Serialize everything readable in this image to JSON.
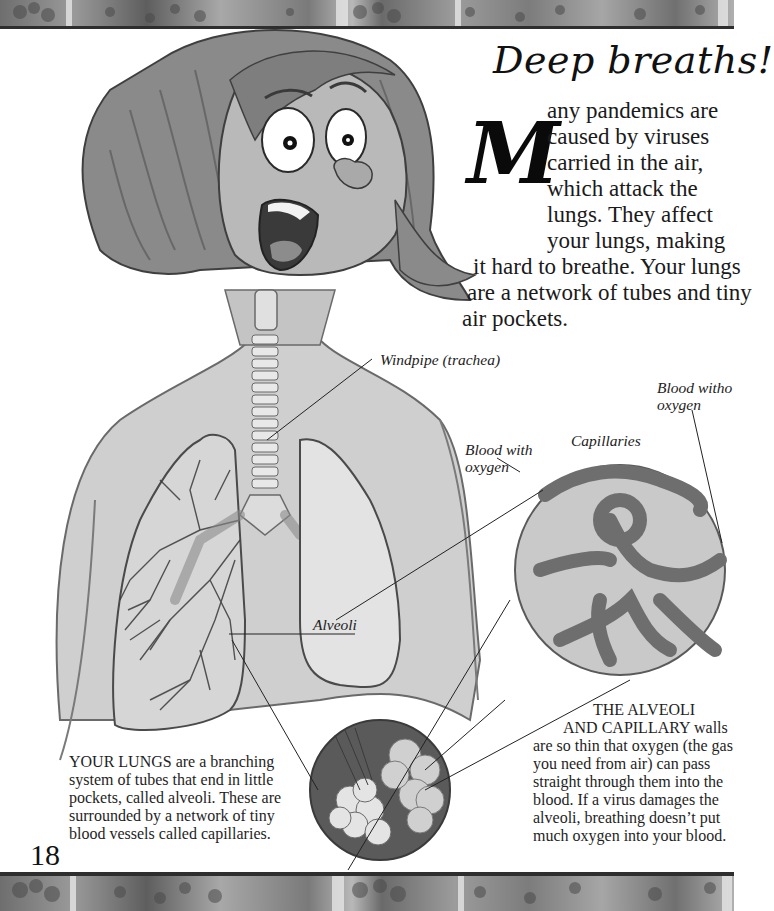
{
  "page": {
    "title": "Deep breaths!",
    "page_number": "18"
  },
  "intro": {
    "dropcap": "M",
    "lines": [
      "any pandemics are",
      "caused by viruses",
      "carried in the air,",
      "which attack the",
      "lungs. They affect",
      "your lungs, making",
      "it hard to breathe. Your lungs",
      "are a network of tubes and tiny",
      "air pockets."
    ]
  },
  "labels": {
    "windpipe": "Windpipe (trachea)",
    "blood_without_oxygen": [
      "Blood witho",
      "oxygen"
    ],
    "blood_with_oxygen": [
      "Blood with",
      "oxygen"
    ],
    "capillaries": "Capillaries",
    "alveoli": "Alveoli"
  },
  "captions": {
    "lungs": {
      "lines": [
        "YOUR LUNGS are a branching",
        "system of tubes that end in little",
        "pockets, called alveoli. These are",
        "surrounded by a network of tiny",
        "blood vessels called capillaries."
      ]
    },
    "alveoli_walls": {
      "lines": [
        "THE ALVEOLI",
        "AND CAPILLARY walls",
        "are so thin that oxygen (the gas",
        "you need from air) can pass",
        "straight through them into the",
        "blood. If a virus damages the",
        "alveoli, breathing doesn’t put",
        "much oxygen into your blood."
      ]
    }
  },
  "illustration": {
    "subject": "cartoon woman with lungs, trachea, alveoli and capillary close-ups",
    "icons": [
      "flower-border-pattern",
      "woman-face",
      "trachea",
      "lungs",
      "alveoli-magnifier",
      "capillary-magnifier"
    ]
  }
}
